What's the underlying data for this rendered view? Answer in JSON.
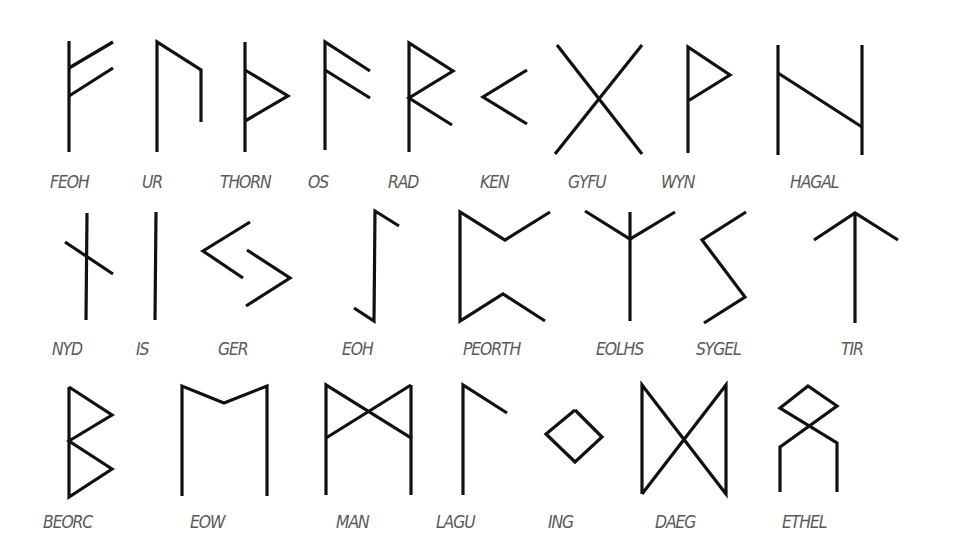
{
  "diagram": {
    "title_visible": false,
    "line_color": "#111111",
    "label_color": "#5a5a5a",
    "runes": [
      {
        "name": "FEOH",
        "row": 1,
        "label_pos": [
          50,
          172
        ],
        "strokes": [
          [
            [
              69,
              41
            ],
            [
              69,
              152
            ]
          ],
          [
            [
              69,
              68
            ],
            [
              113,
              42
            ]
          ],
          [
            [
              69,
              96
            ],
            [
              113,
              68
            ]
          ]
        ]
      },
      {
        "name": "UR",
        "row": 1,
        "label_pos": [
          142,
          172
        ],
        "strokes": [
          [
            [
              157,
              152
            ],
            [
              157,
              42
            ],
            [
              201,
              70
            ],
            [
              201,
              122
            ]
          ]
        ]
      },
      {
        "name": "THORN",
        "row": 1,
        "label_pos": [
          220,
          172
        ],
        "strokes": [
          [
            [
              245,
              42
            ],
            [
              245,
              152
            ]
          ],
          [
            [
              245,
              70
            ],
            [
              288,
              96
            ],
            [
              245,
              121
            ]
          ]
        ]
      },
      {
        "name": "OS",
        "row": 1,
        "label_pos": [
          308,
          172
        ],
        "strokes": [
          [
            [
              325,
              150
            ],
            [
              325,
              42
            ],
            [
              370,
              71
            ]
          ],
          [
            [
              325,
              70
            ],
            [
              370,
              98
            ]
          ]
        ]
      },
      {
        "name": "RAD",
        "row": 1,
        "label_pos": [
          388,
          172
        ],
        "strokes": [
          [
            [
              409,
              152
            ],
            [
              409,
              43
            ],
            [
              453,
              71
            ],
            [
              409,
              98
            ],
            [
              452,
              125
            ]
          ]
        ]
      },
      {
        "name": "KEN",
        "row": 1,
        "label_pos": [
          480,
          172
        ],
        "strokes": [
          [
            [
              527,
              70
            ],
            [
              483,
              97
            ],
            [
              527,
              124
            ]
          ]
        ]
      },
      {
        "name": "GYFU",
        "row": 1,
        "label_pos": [
          568,
          172
        ],
        "strokes": [
          [
            [
              557,
              45
            ],
            [
              642,
              154
            ]
          ],
          [
            [
              642,
              45
            ],
            [
              555,
              154
            ]
          ]
        ]
      },
      {
        "name": "WYN",
        "row": 1,
        "label_pos": [
          661,
          172
        ],
        "strokes": [
          [
            [
              688,
              153
            ],
            [
              688,
              47
            ],
            [
              730,
              75
            ],
            [
              688,
              101
            ]
          ]
        ]
      },
      {
        "name": "HAGAL",
        "row": 1,
        "label_pos": [
          790,
          172
        ],
        "strokes": [
          [
            [
              778,
              45
            ],
            [
              778,
              155
            ]
          ],
          [
            [
              862,
              45
            ],
            [
              862,
              155
            ]
          ],
          [
            [
              778,
              73
            ],
            [
              862,
              127
            ]
          ]
        ]
      },
      {
        "name": "NYD",
        "row": 2,
        "label_pos": [
          52,
          339
        ],
        "strokes": [
          [
            [
              87,
              213
            ],
            [
              86,
              320
            ]
          ],
          [
            [
              65,
              242
            ],
            [
              113,
              274
            ]
          ]
        ]
      },
      {
        "name": "IS",
        "row": 2,
        "label_pos": [
          136,
          339
        ],
        "strokes": [
          [
            [
              156,
              212
            ],
            [
              155,
              320
            ]
          ]
        ]
      },
      {
        "name": "GER",
        "row": 2,
        "label_pos": [
          218,
          339
        ],
        "strokes": [
          [
            [
              250,
              222
            ],
            [
              203,
              251
            ],
            [
              243,
              278
            ]
          ],
          [
            [
              247,
              250
            ],
            [
              290,
              278
            ],
            [
              246,
              306
            ]
          ]
        ]
      },
      {
        "name": "EOH",
        "row": 2,
        "label_pos": [
          342,
          339
        ],
        "strokes": [
          [
            [
              399,
              226
            ],
            [
              375,
              211
            ],
            [
              374,
              321
            ],
            [
              354,
              308
            ]
          ]
        ]
      },
      {
        "name": "PEORTH",
        "row": 2,
        "label_pos": [
          463,
          339
        ],
        "strokes": [
          [
            [
              550,
              212
            ],
            [
              505,
              240
            ],
            [
              460,
              212
            ],
            [
              460,
              321
            ],
            [
              503,
              294
            ],
            [
              545,
              321
            ]
          ]
        ]
      },
      {
        "name": "EOLHS",
        "row": 2,
        "label_pos": [
          596,
          339
        ],
        "strokes": [
          [
            [
              630,
              212
            ],
            [
              630,
              321
            ]
          ],
          [
            [
              585,
              211
            ],
            [
              630,
              239
            ],
            [
              675,
              212
            ]
          ]
        ]
      },
      {
        "name": "SYGEL",
        "row": 2,
        "label_pos": [
          696,
          339
        ],
        "strokes": [
          [
            [
              746,
              212
            ],
            [
              702,
              240
            ],
            [
              745,
              297
            ],
            [
              704,
              323
            ]
          ]
        ]
      },
      {
        "name": "TIR",
        "row": 2,
        "label_pos": [
          841,
          339
        ],
        "strokes": [
          [
            [
              855,
              213
            ],
            [
              855,
              323
            ]
          ],
          [
            [
              814,
              240
            ],
            [
              855,
              213
            ],
            [
              898,
              240
            ]
          ]
        ]
      },
      {
        "name": "BEORC",
        "row": 3,
        "label_pos": [
          43,
          512
        ],
        "strokes": [
          [
            [
              69,
              387
            ],
            [
              69,
              497
            ],
            [
              112,
              469
            ],
            [
              69,
              441
            ],
            [
              112,
              415
            ],
            [
              69,
              387
            ]
          ]
        ]
      },
      {
        "name": "EOW",
        "row": 3,
        "label_pos": [
          190,
          512
        ],
        "strokes": [
          [
            [
              182,
              496
            ],
            [
              182,
              386
            ],
            [
              224,
              403
            ],
            [
              267,
              386
            ],
            [
              267,
              496
            ]
          ]
        ]
      },
      {
        "name": "MAN",
        "row": 3,
        "label_pos": [
          336,
          512
        ],
        "strokes": [
          [
            [
              326,
              495
            ],
            [
              326,
              385
            ],
            [
              411,
              438
            ],
            [
              411,
              495
            ]
          ],
          [
            [
              411,
              385
            ],
            [
              326,
              438
            ]
          ],
          [
            [
              411,
              385
            ],
            [
              411,
              438
            ]
          ]
        ]
      },
      {
        "name": "LAGU",
        "row": 3,
        "label_pos": [
          436,
          512
        ],
        "strokes": [
          [
            [
              463,
              495
            ],
            [
              463,
              385
            ],
            [
              507,
              413
            ]
          ]
        ]
      },
      {
        "name": "ING",
        "row": 3,
        "label_pos": [
          548,
          512
        ],
        "strokes": [
          [
            [
              575,
              410
            ],
            [
              602,
              437
            ],
            [
              575,
              462
            ],
            [
              546,
              434
            ],
            [
              575,
              410
            ]
          ]
        ]
      },
      {
        "name": "DAEG",
        "row": 3,
        "label_pos": [
          655,
          512
        ],
        "strokes": [
          [
            [
              642,
              494
            ],
            [
              642,
              385
            ],
            [
              726,
              494
            ],
            [
              726,
              385
            ],
            [
              642,
              494
            ]
          ]
        ]
      },
      {
        "name": "ETHEL",
        "row": 3,
        "label_pos": [
          782,
          512
        ],
        "strokes": [
          [
            [
              780,
              492
            ],
            [
              780,
              447
            ],
            [
              837,
              406
            ],
            [
              808,
              386
            ],
            [
              780,
              408
            ],
            [
              837,
              443
            ],
            [
              837,
              492
            ]
          ]
        ]
      }
    ]
  }
}
